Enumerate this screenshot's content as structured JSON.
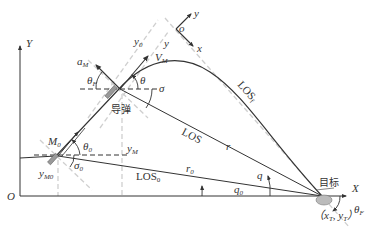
{
  "diagram": {
    "axes": {
      "origin_label": "O",
      "x_label": "X",
      "y_label": "Y"
    },
    "body_frame": {
      "origin_label": "o",
      "x_label": "x",
      "y_label": "y"
    },
    "missile": {
      "label": "导弹",
      "velocity_label": "V",
      "velocity_sub": "M",
      "accel_label": "a",
      "accel_sub": "M",
      "angle_theta": "θ",
      "angle_thetaF": "θ",
      "angle_thetaF_sub": "F",
      "angle_sigma": "σ",
      "y_label": "y",
      "y_sub": "M",
      "y0_label": "y",
      "y0_sub": "0",
      "y_frame_label": "y"
    },
    "initial_point": {
      "label": "M",
      "label_sub": "0",
      "theta0": "θ",
      "theta0_sub": "0",
      "sigma0": "σ",
      "sigma0_sub": "0",
      "y_label": "y",
      "y_sub": "M0"
    },
    "target": {
      "label": "目标",
      "coords": "（x",
      "coords_sub_T1": "T",
      "coords_mid": ", y",
      "coords_sub_T2": "T",
      "coords_end": "）",
      "thetaF": "θ",
      "thetaF_sub": "F"
    },
    "lines": {
      "los": "LOS",
      "los0": "LOS",
      "los0_sub": "0",
      "losf": "LOS",
      "losf_sub": "f",
      "r": "r",
      "r0": "r",
      "r0_sub": "0",
      "q": "q",
      "q0": "q",
      "q0_sub": "0"
    },
    "colors": {
      "line": "#333333",
      "dashed_light": "#c8c8c8",
      "dashed_dark": "#333333"
    }
  }
}
